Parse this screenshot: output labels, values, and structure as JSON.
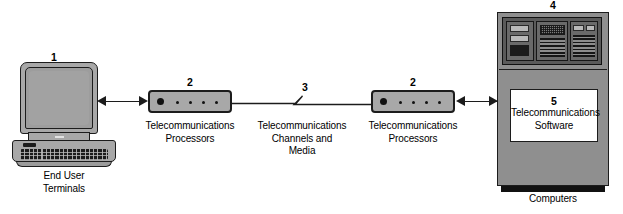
{
  "diagram": {
    "background_color": "#ffffff",
    "line_color": "#1c1c1c",
    "device_fill": "#a8a8a8",
    "mainframe_fill": "#8f8f8f",
    "nodes": [
      {
        "number": "1",
        "icon": "desktop-terminal-icon",
        "caption": "End User\nTerminals"
      },
      {
        "number": "2",
        "icon": "telecom-processor-icon",
        "caption": "Telecommunications\nProcessors"
      },
      {
        "number": "3",
        "icon": "channel-line-icon",
        "caption": "Telecommunications\nChannels and\nMedia"
      },
      {
        "number": "2",
        "icon": "telecom-processor-icon",
        "caption": "Telecommunications\nProcessors"
      },
      {
        "number": "4",
        "icon": "mainframe-computer-icon",
        "caption": "Computers"
      },
      {
        "number": "5",
        "icon": "software-box-icon",
        "caption": "Telecommunications\nSoftware"
      }
    ],
    "connectors": [
      {
        "name": "terminal-to-processor",
        "style": "double-arrow"
      },
      {
        "name": "processor-to-processor",
        "style": "line-with-break"
      },
      {
        "name": "processor-to-computer",
        "style": "double-arrow"
      }
    ]
  }
}
